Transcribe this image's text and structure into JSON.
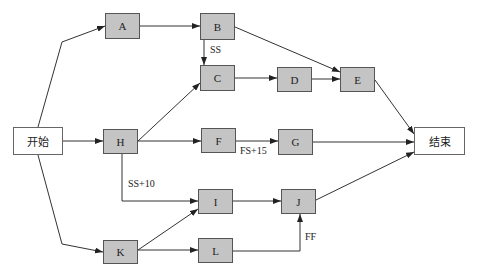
{
  "diagram": {
    "type": "network-schedule",
    "nodes": [
      {
        "id": "start",
        "label": "开始",
        "kind": "terminal",
        "x": 13,
        "y": 127,
        "w": 50,
        "h": 28
      },
      {
        "id": "A",
        "label": "A",
        "kind": "task",
        "x": 105,
        "y": 13,
        "w": 35,
        "h": 26
      },
      {
        "id": "B",
        "label": "B",
        "kind": "task",
        "x": 200,
        "y": 13,
        "w": 35,
        "h": 27
      },
      {
        "id": "C",
        "label": "C",
        "kind": "task",
        "x": 200,
        "y": 65,
        "w": 35,
        "h": 26
      },
      {
        "id": "D",
        "label": "D",
        "kind": "task",
        "x": 277,
        "y": 67,
        "w": 35,
        "h": 25
      },
      {
        "id": "E",
        "label": "E",
        "kind": "task",
        "x": 340,
        "y": 67,
        "w": 35,
        "h": 25
      },
      {
        "id": "H",
        "label": "H",
        "kind": "task",
        "x": 103,
        "y": 129,
        "w": 35,
        "h": 25
      },
      {
        "id": "F",
        "label": "F",
        "kind": "task",
        "x": 201,
        "y": 128,
        "w": 35,
        "h": 25
      },
      {
        "id": "G",
        "label": "G",
        "kind": "task",
        "x": 278,
        "y": 129,
        "w": 35,
        "h": 26
      },
      {
        "id": "I",
        "label": "I",
        "kind": "task",
        "x": 198,
        "y": 189,
        "w": 35,
        "h": 25
      },
      {
        "id": "J",
        "label": "J",
        "kind": "task",
        "x": 281,
        "y": 189,
        "w": 35,
        "h": 25
      },
      {
        "id": "K",
        "label": "K",
        "kind": "task",
        "x": 103,
        "y": 240,
        "w": 35,
        "h": 24
      },
      {
        "id": "L",
        "label": "L",
        "kind": "task",
        "x": 198,
        "y": 238,
        "w": 35,
        "h": 25
      },
      {
        "id": "end",
        "label": "结束",
        "kind": "terminal",
        "x": 414,
        "y": 127,
        "w": 51,
        "h": 28
      }
    ],
    "edges": [
      {
        "from": "start",
        "to": "A",
        "points": [
          [
            38,
            127
          ],
          [
            62,
            42
          ],
          [
            105,
            26
          ]
        ]
      },
      {
        "from": "start",
        "to": "H",
        "points": [
          [
            63,
            141
          ],
          [
            103,
            141
          ]
        ]
      },
      {
        "from": "start",
        "to": "K",
        "points": [
          [
            38,
            155
          ],
          [
            62,
            244
          ],
          [
            103,
            252
          ]
        ]
      },
      {
        "from": "A",
        "to": "B",
        "points": [
          [
            140,
            26
          ],
          [
            200,
            26
          ]
        ]
      },
      {
        "from": "B",
        "to": "C",
        "points": [
          [
            204,
            40
          ],
          [
            204,
            65
          ]
        ],
        "label": "SS",
        "lx": 210,
        "ly": 44
      },
      {
        "from": "B",
        "to": "E",
        "points": [
          [
            235,
            27
          ],
          [
            340,
            72
          ]
        ]
      },
      {
        "from": "C",
        "to": "D",
        "points": [
          [
            235,
            78
          ],
          [
            277,
            78
          ]
        ]
      },
      {
        "from": "D",
        "to": "E",
        "points": [
          [
            312,
            79
          ],
          [
            340,
            79
          ]
        ]
      },
      {
        "from": "E",
        "to": "end",
        "points": [
          [
            375,
            80
          ],
          [
            414,
            134
          ]
        ]
      },
      {
        "from": "H",
        "to": "C",
        "points": [
          [
            138,
            141
          ],
          [
            200,
            83
          ]
        ]
      },
      {
        "from": "H",
        "to": "F",
        "points": [
          [
            138,
            141
          ],
          [
            201,
            141
          ]
        ]
      },
      {
        "from": "F",
        "to": "G",
        "points": [
          [
            236,
            141
          ],
          [
            278,
            141
          ]
        ],
        "label": "FS+15",
        "lx": 240,
        "ly": 145
      },
      {
        "from": "G",
        "to": "end",
        "points": [
          [
            313,
            142
          ],
          [
            414,
            142
          ]
        ]
      },
      {
        "from": "H",
        "to": "I",
        "points": [
          [
            122,
            154
          ],
          [
            122,
            201
          ],
          [
            198,
            201
          ]
        ],
        "label": "SS+10",
        "lx": 128,
        "ly": 178
      },
      {
        "from": "K",
        "to": "I",
        "points": [
          [
            138,
            250
          ],
          [
            198,
            209
          ]
        ]
      },
      {
        "from": "K",
        "to": "L",
        "points": [
          [
            138,
            250
          ],
          [
            198,
            250
          ]
        ]
      },
      {
        "from": "I",
        "to": "J",
        "points": [
          [
            233,
            201
          ],
          [
            281,
            201
          ]
        ]
      },
      {
        "from": "L",
        "to": "J",
        "points": [
          [
            233,
            251
          ],
          [
            300,
            251
          ],
          [
            300,
            214
          ]
        ],
        "label": "FF",
        "lx": 305,
        "ly": 231
      },
      {
        "from": "J",
        "to": "end",
        "points": [
          [
            316,
            200
          ],
          [
            414,
            152
          ]
        ]
      }
    ],
    "colors": {
      "task_fill": "#c4c4c4",
      "terminal_fill": "#ffffff",
      "border": "#555555",
      "line": "#333333"
    }
  }
}
